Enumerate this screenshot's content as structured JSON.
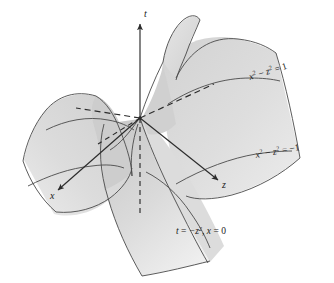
{
  "figure": {
    "background_color": "#ffffff",
    "surface_fill_light": "#e3e3e3",
    "surface_fill_mid": "#d6d6d6",
    "surface_fill_dark": "#c6c6c6",
    "outline_color": "#4a4a4a",
    "axis_color": "#2b2b2b",
    "label_color": "#1a1a1a"
  },
  "axes": [
    {
      "id": "t-axis",
      "label": "t",
      "direction": "up",
      "arrow": true,
      "style": "solid",
      "label_x": 144,
      "label_y": 14
    },
    {
      "id": "x-axis",
      "label": "x",
      "direction": "lower-left",
      "arrow": true,
      "style": "solid",
      "label_x": 52,
      "label_y": 196
    },
    {
      "id": "z-axis",
      "label": "z",
      "direction": "lower-right",
      "arrow": true,
      "style": "solid",
      "label_x": 224,
      "label_y": 186
    },
    {
      "id": "t-axis-negative",
      "label": "",
      "direction": "down",
      "arrow": false,
      "style": "dashed",
      "label_x": 0,
      "label_y": 0
    }
  ],
  "curve_labels": [
    {
      "id": "level-curve-upper",
      "base": "x",
      "exp1": "2",
      "minus": " − ",
      "var2": "z",
      "exp2": "2",
      "equals": " = ",
      "value": "1",
      "text": "x² − z² = 1",
      "x": 252,
      "y": 78,
      "rotation": -17
    },
    {
      "id": "level-curve-lower",
      "base": "x",
      "exp1": "2",
      "minus": " − ",
      "var2": "z",
      "exp2": "2",
      "equals": " = ",
      "value": "−1",
      "text": "x² − z² = −1",
      "x": 258,
      "y": 156,
      "rotation": -10
    },
    {
      "id": "trace-curve",
      "text": "t = −z², x = 0",
      "lhs": "t",
      "eq1": " = ",
      "rhs1": "−z",
      "exp": "2",
      "sep": ", ",
      "lhs2": "x",
      "eq2": " = ",
      "rhs2": "0",
      "x": 176,
      "y": 232,
      "rotation": 0
    }
  ],
  "dashed_rays": [
    {
      "id": "asymptote-upper-right",
      "from": "origin",
      "to": "upper-right"
    },
    {
      "id": "asymptote-lower-left",
      "from": "origin",
      "to": "lower-left"
    },
    {
      "id": "asymptote-down",
      "from": "origin",
      "to": "down"
    }
  ],
  "surface_parts": [
    {
      "id": "right-sheet",
      "description": "right sheet of saddle surface"
    },
    {
      "id": "left-lobe",
      "description": "left lobe of saddle surface"
    },
    {
      "id": "front-sheet",
      "description": "front lower sheet of saddle surface"
    },
    {
      "id": "upper-fold",
      "description": "upper curved fold of saddle surface"
    }
  ]
}
